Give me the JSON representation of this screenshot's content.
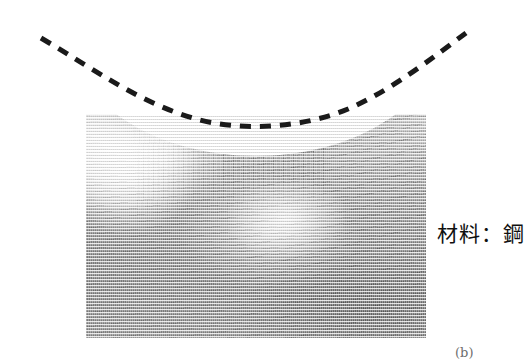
{
  "figure": {
    "type": "metallographic-micrograph",
    "background_color": "#ffffff",
    "caption_material": "材料：鋼",
    "figure_label_partial": "(b)",
    "specimen": {
      "description": "steel cross-section showing indented notch with deformed grain flow lines",
      "photo_bounds_px": {
        "x": 86,
        "y": 114,
        "width": 340,
        "height": 224
      },
      "tone_light": "#d8d8d8",
      "tone_mid": "#9a9a9a",
      "tone_dark": "#8a8a8a"
    },
    "profile_curve": {
      "style": "dashed",
      "color": "#1a1a1a",
      "stroke_width": 5,
      "dash_length": 11,
      "dash_gap": 9,
      "path": "M 41 38 C 95 70, 140 103, 196 119 C 240 131, 300 129, 348 109 C 392 90, 432 58, 466 33",
      "meaning": "original surface contour before indentation"
    }
  }
}
